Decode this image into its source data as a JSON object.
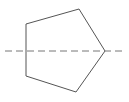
{
  "figure": {
    "canvas": {
      "width": 129,
      "height": 102,
      "background_color": "#ffffff"
    },
    "shape": {
      "name": "pentagon",
      "sides": 5,
      "points": "26,24 79,9 105,51 76,92 26,76",
      "vertices": [
        {
          "label": "top-left",
          "x": 26,
          "y": 24
        },
        {
          "label": "top",
          "x": 79,
          "y": 9
        },
        {
          "label": "right",
          "x": 105,
          "y": 51
        },
        {
          "label": "bottom",
          "x": 76,
          "y": 92
        },
        {
          "label": "bottom-left",
          "x": 26,
          "y": 76
        }
      ],
      "stroke_color": "#555555",
      "fill_color": "#ffffff",
      "stroke_width": 1
    },
    "axis": {
      "name": "axis-of-symmetry",
      "orientation": "horizontal",
      "x1": 5,
      "y1": 51,
      "x2": 122,
      "y2": 51,
      "stroke_color": "#777777",
      "stroke_width": 1,
      "dash_pattern": "7 4"
    }
  }
}
